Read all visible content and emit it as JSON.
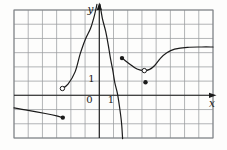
{
  "figure": {
    "kind": "math-function-graph",
    "background": "#fdfdfc",
    "ink_color": "#1b1b1b",
    "grid_color": "#9a9c9f",
    "border_color": "#7f8286",
    "width_px": 227,
    "height_px": 150
  },
  "chart_data": {
    "type": "line",
    "title": "",
    "xlabel": "x",
    "ylabel": "y",
    "origin_label": "0",
    "x_tick_label": "1",
    "y_tick_label": "1",
    "xlim": [
      -6,
      8
    ],
    "ylim": [
      -3,
      6.5
    ],
    "grid": "on",
    "grid_cell": 1,
    "layout": {
      "border_px": {
        "x0": 14,
        "y0": 10,
        "x1": 213,
        "y1": 138
      },
      "grid_cols": 14,
      "grid_rows": 9,
      "origin_px": [
        99.3,
        95.3
      ],
      "unit_px": 14.21,
      "x_axis_px": {
        "from": 14,
        "to": 211,
        "arrow_tip": 216.5
      },
      "y_axis_px": {
        "from": 138,
        "to": 9,
        "arrow_tip": 2.5
      },
      "point_radius_px": 2.2
    },
    "series": [
      {
        "name": "piece-1-left",
        "endpoint": "closed-at-right",
        "points": [
          [
            -6.0,
            -0.89
          ],
          [
            -5.0,
            -1.06
          ],
          [
            -3.8,
            -1.28
          ],
          [
            -3.0,
            -1.45
          ],
          [
            -2.57,
            -1.57
          ]
        ]
      },
      {
        "name": "piece-2-middle-rises-to-plus-infinity",
        "endpoint": "open-at-left",
        "points": [
          [
            -2.6,
            0.48
          ],
          [
            -2.2,
            0.78
          ],
          [
            -1.7,
            1.65
          ],
          [
            -1.35,
            2.9
          ],
          [
            -1.0,
            3.9
          ],
          [
            -0.62,
            4.7
          ],
          [
            -0.4,
            5.4
          ],
          [
            -0.25,
            6.0
          ],
          [
            -0.17,
            6.4
          ]
        ]
      },
      {
        "name": "piece-3-falls-from-plus-infinity-to-minus-infinity",
        "endpoint": "none",
        "points": [
          [
            0.05,
            6.4
          ],
          [
            0.22,
            5.4
          ],
          [
            0.45,
            4.5
          ],
          [
            0.62,
            3.6
          ],
          [
            0.77,
            2.7
          ],
          [
            0.95,
            1.75
          ],
          [
            1.1,
            0.85
          ],
          [
            1.28,
            0.1
          ],
          [
            1.45,
            -1.0
          ],
          [
            1.57,
            -2.0
          ],
          [
            1.64,
            -3.05
          ]
        ]
      },
      {
        "name": "piece-4-right-with-dip-and-plateau",
        "endpoint": "closed-at-left-open-at-dip",
        "points": [
          [
            1.6,
            2.62
          ],
          [
            2.2,
            2.15
          ],
          [
            2.65,
            1.85
          ],
          [
            3.17,
            1.74
          ],
          [
            3.55,
            1.82
          ],
          [
            3.9,
            2.1
          ],
          [
            4.3,
            2.6
          ],
          [
            4.75,
            3.0
          ],
          [
            5.3,
            3.25
          ],
          [
            6.2,
            3.38
          ],
          [
            7.2,
            3.4
          ],
          [
            8.0,
            3.4
          ]
        ]
      }
    ],
    "open_points": [
      [
        -2.6,
        0.48
      ],
      [
        3.17,
        1.74
      ]
    ],
    "closed_points": [
      [
        -2.57,
        -1.57
      ],
      [
        1.6,
        2.62
      ],
      [
        3.25,
        0.92
      ]
    ],
    "asymptotes": {
      "vertical_x": [
        0,
        1.7
      ],
      "horizontal_y_as_x_to_plus_infinity": 3.4
    }
  }
}
